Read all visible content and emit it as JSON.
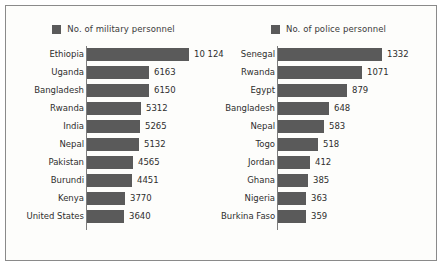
{
  "chart_data": [
    {
      "type": "bar",
      "orientation": "horizontal",
      "title": "",
      "legend_label": "No. of military personnel",
      "legend_position": "top-center",
      "xlabel": "",
      "ylabel": "",
      "grid": false,
      "xlim": [
        0,
        10124
      ],
      "bar_color": "#5a5a5a",
      "categories": [
        "Ethiopia",
        "Uganda",
        "Bangladesh",
        "Rwanda",
        "India",
        "Nepal",
        "Pakistan",
        "Burundi",
        "Kenya",
        "United States"
      ],
      "values": [
        10124,
        6163,
        6150,
        5312,
        5265,
        5132,
        4565,
        4451,
        3770,
        3640
      ],
      "value_labels": [
        "10 124",
        "6163",
        "6150",
        "5312",
        "5265",
        "5132",
        "4565",
        "4451",
        "3770",
        "3640"
      ]
    },
    {
      "type": "bar",
      "orientation": "horizontal",
      "title": "",
      "legend_label": "No. of police personnel",
      "legend_position": "top-center",
      "xlabel": "",
      "ylabel": "",
      "grid": false,
      "xlim": [
        0,
        1332
      ],
      "bar_color": "#5a5a5a",
      "categories": [
        "Senegal",
        "Rwanda",
        "Egypt",
        "Bangladesh",
        "Nepal",
        "Togo",
        "Jordan",
        "Ghana",
        "Nigeria",
        "Burkina Faso"
      ],
      "values": [
        1332,
        1071,
        879,
        648,
        583,
        518,
        412,
        385,
        363,
        359
      ],
      "value_labels": [
        "1332",
        "1071",
        "879",
        "648",
        "583",
        "518",
        "412",
        "385",
        "363",
        "359"
      ]
    }
  ],
  "colors": {
    "bar": "#5a5a5a",
    "legend_swatch": "#5a5a5a",
    "axis": "#7d7d7d",
    "border": "#8a8a8a",
    "background": "#fdfdfb",
    "text": "#2e2e2e"
  }
}
